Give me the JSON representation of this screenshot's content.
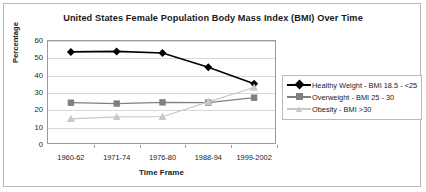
{
  "chart_data": {
    "type": "line",
    "title": "United States Female Population Body Mass Index (BMI) Over Time",
    "xlabel": "Time Frame",
    "ylabel": "Percentage",
    "categories": [
      "1960-62",
      "1971-74",
      "1976-80",
      "1988-94",
      "1999-2002"
    ],
    "ylim": [
      0,
      60
    ],
    "yticks": [
      0,
      10,
      20,
      30,
      40,
      50,
      60
    ],
    "grid": true,
    "legend_position": "right",
    "series": [
      {
        "name": "Healthy Weight - BMI 18.5 - <25",
        "values": [
          53.7,
          54.0,
          53.1,
          44.9,
          35.4
        ],
        "color": "#000000",
        "marker": "diamond"
      },
      {
        "name": "Overweight - BMI 25 - 30",
        "values": [
          24.4,
          23.9,
          24.6,
          24.5,
          27.3
        ],
        "color": "#808080",
        "marker": "square"
      },
      {
        "name": "Obesity - BMI  >30",
        "values": [
          15.1,
          16.2,
          16.3,
          24.9,
          33.2
        ],
        "color": "#c8c8c8",
        "marker": "triangle"
      }
    ]
  }
}
